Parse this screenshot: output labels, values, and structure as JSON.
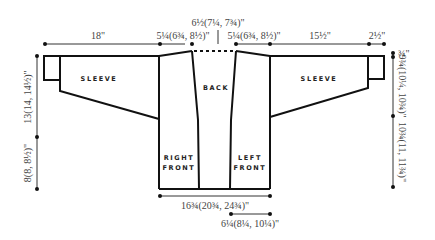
{
  "diagram": {
    "pieces": {
      "left_sleeve": "SLEEVE",
      "right_sleeve": "SLEEVE",
      "back": "BACK",
      "right_front": [
        "RIGHT",
        "FRONT"
      ],
      "left_front": [
        "LEFT",
        "FRONT"
      ]
    },
    "dimensions": {
      "top_left_sleeve_length": "18\"",
      "top_left_shoulder": "5¼(6¾, 8½)\"",
      "top_back_neck": "6½(7¼, 7¾)\"",
      "top_right_shoulder": "5¼(6¾, 8½)\"",
      "top_right_sleeve_length": "15½\"",
      "top_right_cuff": "2½\"",
      "left_vertical_upper": "13(14, 14½)\"",
      "left_vertical_lower": "8(8, 8½)\"",
      "right_vertical_top": "¾\"",
      "right_vertical_upper": "9¾(10¼, 10¾)\"",
      "right_vertical_lower": "10¾(11, 11¾)\"",
      "bottom_width": "16¾(20¾, 24¾)\"",
      "bottom_front_width": "6¼(8¼, 10¼)\""
    },
    "colors": {
      "line": "#111111",
      "text": "#444444",
      "background": "#ffffff"
    }
  }
}
